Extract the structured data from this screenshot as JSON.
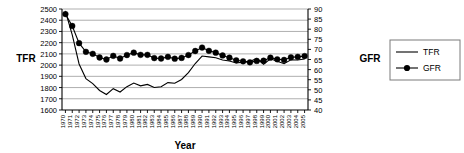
{
  "chart_data": {
    "type": "line",
    "title": "",
    "xlabel": "Year",
    "ylabel": "TFR",
    "y2label": "GFR",
    "grid": true,
    "legend_position": "right",
    "ylim": [
      1600,
      2500
    ],
    "y2lim": [
      40,
      90
    ],
    "ytick_step": 100,
    "y2tick_step": 5,
    "yticks": [
      2500,
      2400,
      2300,
      2200,
      2100,
      2000,
      1900,
      1800,
      1700,
      1600
    ],
    "y2ticks": [
      90,
      85,
      80,
      75,
      70,
      65,
      60,
      55,
      50,
      45,
      40
    ],
    "x": [
      "1970",
      "1971",
      "1972",
      "1973",
      "1974",
      "1975",
      "1976",
      "1977",
      "1978",
      "1979",
      "1980",
      "1981",
      "1982",
      "1983",
      "1984",
      "1985",
      "1986",
      "1987",
      "1988",
      "1989",
      "1990",
      "1991",
      "1992",
      "1993",
      "1994",
      "1995",
      "1996",
      "1997",
      "1998",
      "1999",
      "2000",
      "2001",
      "2002",
      "2003",
      "2004",
      "2005"
    ],
    "series": [
      {
        "name": "TFR",
        "axis": "left",
        "marker": "none",
        "values": [
          2480,
          2270,
          2010,
          1880,
          1835,
          1774,
          1738,
          1790,
          1760,
          1808,
          1840,
          1815,
          1828,
          1800,
          1807,
          1844,
          1838,
          1872,
          1934,
          2014,
          2081,
          2073,
          2065,
          2046,
          2036,
          2019,
          2027,
          2033,
          2059,
          2008,
          2056,
          2034,
          2013,
          2048,
          2046,
          2054
        ]
      },
      {
        "name": "GFR",
        "axis": "right",
        "marker": "filled-circle",
        "values": [
          87.5,
          81.6,
          73.1,
          68.8,
          67.8,
          66.0,
          65.0,
          66.8,
          65.5,
          67.2,
          68.4,
          67.3,
          67.3,
          65.7,
          65.5,
          66.3,
          65.4,
          65.8,
          67.2,
          69.2,
          70.9,
          69.3,
          68.4,
          67.0,
          65.9,
          64.6,
          64.1,
          63.6,
          64.3,
          64.4,
          65.9,
          65.1,
          64.8,
          66.1,
          66.3,
          66.7
        ]
      }
    ],
    "annotations": []
  },
  "legend": {
    "items": [
      {
        "label": "TFR",
        "style": "line"
      },
      {
        "label": "GFR",
        "style": "line-marker"
      }
    ]
  },
  "labels": {
    "left_axis_title": "TFR",
    "right_axis_title": "GFR",
    "x_axis_title": "Year"
  }
}
